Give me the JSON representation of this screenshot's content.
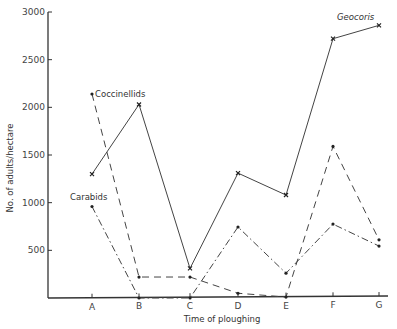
{
  "chart_data": {
    "type": "line",
    "title": "",
    "xlabel": "Time of ploughing",
    "ylabel": "No. of adults/hectare",
    "categories": [
      "A",
      "B",
      "C",
      "D",
      "E",
      "F",
      "G"
    ],
    "yticks": [
      500,
      1000,
      1500,
      2000,
      2500,
      3000
    ],
    "ylim": [
      0,
      3000
    ],
    "grid": false,
    "series": [
      {
        "name": "Geocoris",
        "style": "solid",
        "marker": "x",
        "values": [
          1300,
          2030,
          310,
          1310,
          1080,
          2720,
          2860
        ]
      },
      {
        "name": "Coccinellids",
        "style": "dashed",
        "marker": "dot",
        "values": [
          2140,
          220,
          220,
          50,
          10,
          1590,
          610
        ]
      },
      {
        "name": "Carabids",
        "style": "dash-dot",
        "marker": "dot",
        "values": [
          960,
          0,
          0,
          745,
          260,
          775,
          545
        ]
      }
    ]
  }
}
